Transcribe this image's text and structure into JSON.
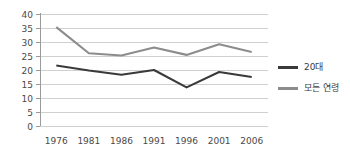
{
  "chart_data": {
    "type": "line",
    "title": "",
    "xlabel": "",
    "ylabel": "",
    "categories": [
      "1976",
      "1981",
      "1986",
      "1991",
      "1996",
      "2001",
      "2006"
    ],
    "ylim": [
      0,
      40
    ],
    "yticks": [
      "0",
      "5",
      "10",
      "15",
      "20",
      "25",
      "30",
      "35",
      "40"
    ],
    "grid": "horizontal",
    "legend_position": "right",
    "series": [
      {
        "name": "20대",
        "color": "#3a3a3a",
        "values": [
          21.6,
          19.8,
          18.3,
          20.0,
          13.8,
          19.3,
          17.5
        ]
      },
      {
        "name": "모든 연령",
        "color": "#8c8c8c",
        "values": [
          35.3,
          26.0,
          25.2,
          28.0,
          25.4,
          29.2,
          26.4
        ]
      }
    ]
  },
  "legend": {
    "items": [
      {
        "label": "20대",
        "color": "#3a3a3a"
      },
      {
        "label": "모든 연령",
        "color": "#8c8c8c"
      }
    ]
  },
  "colors": {
    "series_dark": "#3a3a3a",
    "series_gray": "#8c8c8c",
    "gridline": "#d0d0d0",
    "axis": "#9a9a9a",
    "text": "#3b3b3b",
    "background": "#ffffff"
  }
}
